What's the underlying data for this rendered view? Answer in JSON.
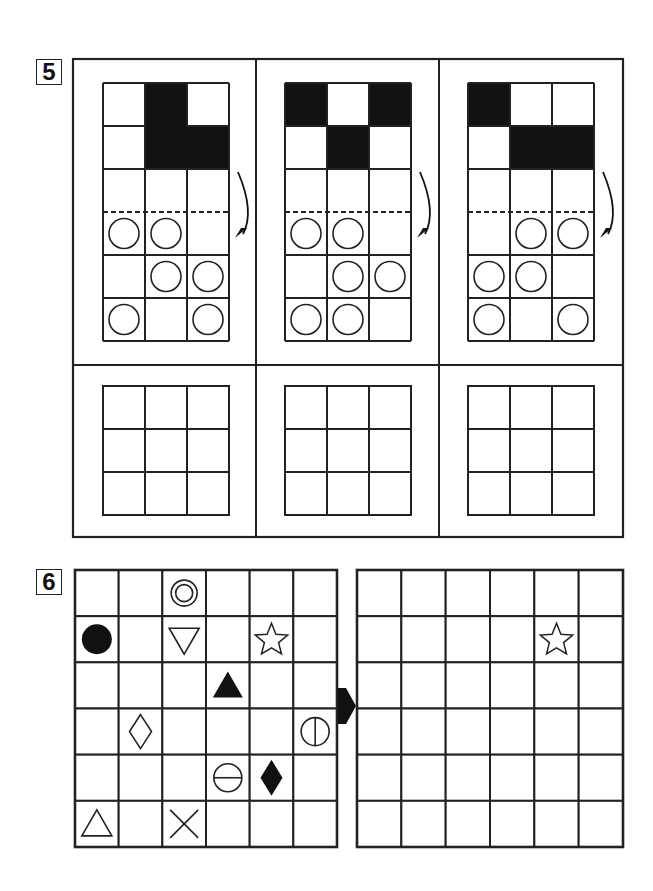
{
  "colors": {
    "ink": "#111111",
    "line": "#222222",
    "paper": "#ffffff"
  },
  "puzzles": [
    {
      "number": "5",
      "panels": [
        {
          "fold_arrow": "curved-arrow-down",
          "top_grid": [
            [
              "empty",
              "filled",
              "empty"
            ],
            [
              "empty",
              "filled",
              "filled"
            ],
            [
              "empty",
              "empty",
              "empty"
            ],
            [
              "circle",
              "circle",
              "empty"
            ],
            [
              "empty",
              "circle",
              "circle"
            ],
            [
              "circle",
              "empty",
              "circle"
            ]
          ],
          "fold_line_after_row": 3,
          "answer_grid": [
            [
              "",
              "",
              ""
            ],
            [
              "",
              "",
              ""
            ],
            [
              "",
              "",
              ""
            ]
          ]
        },
        {
          "fold_arrow": "curved-arrow-down",
          "top_grid": [
            [
              "filled",
              "empty",
              "filled"
            ],
            [
              "empty",
              "filled",
              "empty"
            ],
            [
              "empty",
              "empty",
              "empty"
            ],
            [
              "circle",
              "circle",
              "empty"
            ],
            [
              "empty",
              "circle",
              "circle"
            ],
            [
              "circle",
              "circle",
              "empty"
            ]
          ],
          "fold_line_after_row": 3,
          "answer_grid": [
            [
              "",
              "",
              ""
            ],
            [
              "",
              "",
              ""
            ],
            [
              "",
              "",
              ""
            ]
          ]
        },
        {
          "fold_arrow": "curved-arrow-down",
          "top_grid": [
            [
              "filled",
              "empty",
              "empty"
            ],
            [
              "empty",
              "filled",
              "filled"
            ],
            [
              "empty",
              "empty",
              "empty"
            ],
            [
              "empty",
              "circle",
              "circle"
            ],
            [
              "circle",
              "circle",
              "empty"
            ],
            [
              "circle",
              "empty",
              "circle"
            ]
          ],
          "fold_line_after_row": 3,
          "answer_grid": [
            [
              "",
              "",
              ""
            ],
            [
              "",
              "",
              ""
            ],
            [
              "",
              "",
              ""
            ]
          ]
        }
      ]
    },
    {
      "number": "6",
      "source_grid": {
        "rows": 6,
        "cols": 6,
        "symbols": [
          {
            "row": 0,
            "col": 2,
            "shape": "double-circle"
          },
          {
            "row": 1,
            "col": 0,
            "shape": "filled-circle"
          },
          {
            "row": 1,
            "col": 2,
            "shape": "down-triangle-outline"
          },
          {
            "row": 1,
            "col": 4,
            "shape": "star-outline"
          },
          {
            "row": 2,
            "col": 3,
            "shape": "filled-triangle"
          },
          {
            "row": 3,
            "col": 1,
            "shape": "diamond-outline"
          },
          {
            "row": 3,
            "col": 5,
            "shape": "circle-vertical-bar"
          },
          {
            "row": 4,
            "col": 3,
            "shape": "circle-horizontal-bar"
          },
          {
            "row": 4,
            "col": 4,
            "shape": "filled-diamond"
          },
          {
            "row": 5,
            "col": 0,
            "shape": "up-triangle-outline"
          },
          {
            "row": 5,
            "col": 2,
            "shape": "cross"
          }
        ]
      },
      "arrow": "right-arrow",
      "answer_grid": {
        "rows": 6,
        "cols": 6,
        "symbols": [
          {
            "row": 1,
            "col": 4,
            "shape": "star-outline"
          }
        ]
      }
    }
  ]
}
